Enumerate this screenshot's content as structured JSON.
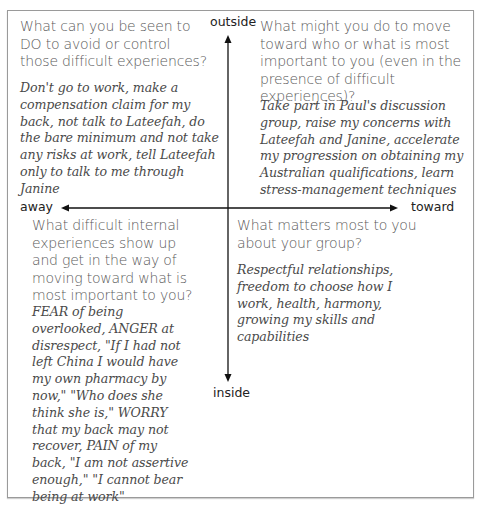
{
  "diagram": {
    "type": "quadrant-matrix",
    "axes": {
      "vertical_top_label": "outside",
      "vertical_bottom_label": "inside",
      "horizontal_left_label": "away",
      "horizontal_right_label": "toward"
    },
    "quadrants": {
      "top_left": {
        "question": "What can you be seen to DO to avoid or control those difficult experiences?",
        "answer": "Don't go to work, make a compensation claim for my back, not talk to Lateefah, do the bare minimum and not take any risks at work, tell Lateefah only to talk to me through Janine"
      },
      "top_right": {
        "question": "What might you do to move toward who or what is most important to you (even in the presence of difficult experiences)?",
        "answer": "Take part in Paul's discussion group, raise my concerns with Lateefah and Janine, accelerate my progression on obtaining my Australian qualifications, learn stress-management techniques"
      },
      "bottom_left": {
        "question": "What difficult internal experiences show up and get in the way of moving toward what is most important to you?",
        "answer": "FEAR of being overlooked, ANGER at disrespect, \"If I had not left China I would have my own pharmacy by now,\" \"Who does she think she is,\" WORRY that my back may not recover, PAIN of my back, \"I am not assertive enough,\" \"I cannot bear being at work\""
      },
      "bottom_right": {
        "question": "What matters most to you about your group?",
        "answer": "Respectful relationships, freedom to choose how I work, health, harmony, growing my skills and capabilities"
      }
    }
  }
}
